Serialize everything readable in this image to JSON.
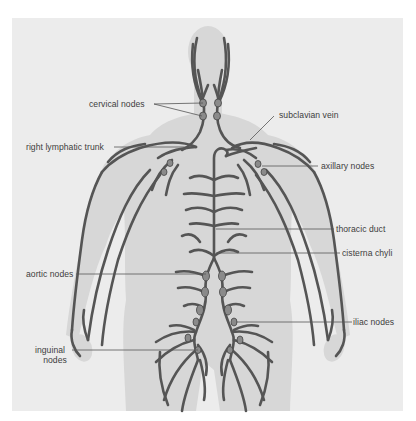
{
  "figure": {
    "colors": {
      "background": "#ffffff",
      "panel": "#ececec",
      "silhouette": "#d6d6d6",
      "vessel": "#555555",
      "vessel_outline": "#3e3e3e",
      "node": "#8a8a8a",
      "leader_line": "#555555",
      "label_text": "#3d3d3d"
    },
    "labels": {
      "cervical_nodes": "cervical nodes",
      "subclavian_vein": "subclavian vein",
      "right_lymphatic_trunk": "right lymphatic trunk",
      "axillary_nodes": "axillary nodes",
      "thoracic_duct": "thoracic duct",
      "cisterna_chyli": "cisterna chyli",
      "aortic_nodes": "aortic nodes",
      "iliac_nodes": "iliac nodes",
      "inguinal_nodes_line1": "inguinal",
      "inguinal_nodes_line2": "nodes"
    }
  }
}
